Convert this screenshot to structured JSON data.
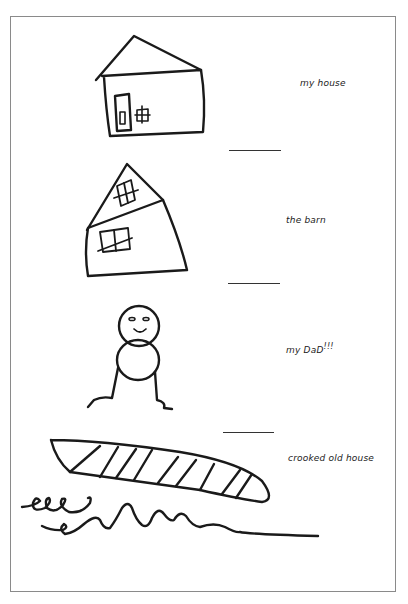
{
  "page": {
    "sections": [
      {
        "label": "my house",
        "drawing": "house-drawing"
      },
      {
        "label": "the barn",
        "drawing": "barn-drawing"
      },
      {
        "label": "my dad!!!",
        "label_text": "my DaD",
        "label_suffix": "!!!",
        "drawing": "stick-figure-drawing"
      },
      {
        "label": "crooked old house",
        "drawing": "boat-drawing"
      }
    ]
  }
}
